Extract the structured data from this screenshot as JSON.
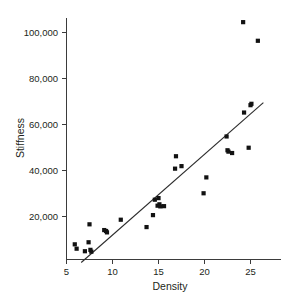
{
  "chart_data": {
    "type": "scatter",
    "title": "",
    "xlabel": "Density",
    "ylabel": "Stiffness",
    "xlim": [
      5,
      26.5
    ],
    "ylim": [
      0,
      108000
    ],
    "grid": false,
    "legend": null,
    "x_ticks": [
      5,
      10,
      15,
      20,
      25
    ],
    "x_tick_labels": [
      "5",
      "10",
      "15",
      "20",
      "25"
    ],
    "y_ticks": [
      20000,
      40000,
      60000,
      80000,
      100000
    ],
    "y_tick_labels": [
      "20,000",
      "40,000",
      "60,000",
      "80,000",
      "100,000"
    ],
    "marker": "square",
    "marker_color": "#121212",
    "points": [
      {
        "x": 5.9,
        "y": 7900
      },
      {
        "x": 6.1,
        "y": 6000
      },
      {
        "x": 7.0,
        "y": 4900
      },
      {
        "x": 7.4,
        "y": 8800
      },
      {
        "x": 7.5,
        "y": 16600
      },
      {
        "x": 7.6,
        "y": 5500
      },
      {
        "x": 7.7,
        "y": 4700
      },
      {
        "x": 9.1,
        "y": 14100
      },
      {
        "x": 9.3,
        "y": 13700
      },
      {
        "x": 9.4,
        "y": 13100
      },
      {
        "x": 10.9,
        "y": 18600
      },
      {
        "x": 13.7,
        "y": 15400
      },
      {
        "x": 14.4,
        "y": 20600
      },
      {
        "x": 14.6,
        "y": 27300
      },
      {
        "x": 14.9,
        "y": 24700
      },
      {
        "x": 15.0,
        "y": 28000
      },
      {
        "x": 15.1,
        "y": 25300
      },
      {
        "x": 15.2,
        "y": 24400
      },
      {
        "x": 15.6,
        "y": 24500
      },
      {
        "x": 16.8,
        "y": 40800
      },
      {
        "x": 16.9,
        "y": 46200
      },
      {
        "x": 17.5,
        "y": 41900
      },
      {
        "x": 19.9,
        "y": 30100
      },
      {
        "x": 20.2,
        "y": 37000
      },
      {
        "x": 22.4,
        "y": 54800
      },
      {
        "x": 22.5,
        "y": 48800
      },
      {
        "x": 22.6,
        "y": 48200
      },
      {
        "x": 23.0,
        "y": 47600
      },
      {
        "x": 24.2,
        "y": 104500
      },
      {
        "x": 24.3,
        "y": 65200
      },
      {
        "x": 24.8,
        "y": 49900
      },
      {
        "x": 25.0,
        "y": 68400
      },
      {
        "x": 25.1,
        "y": 69000
      },
      {
        "x": 25.8,
        "y": 96400
      }
    ],
    "fit_line": {
      "label": "least-squares fit",
      "x_start": 6.6,
      "y_start": 0,
      "x_end": 26.4,
      "y_end": 69500
    }
  },
  "figure": {
    "background_color": "#ffffff",
    "axis_color": "#3b3b3b"
  }
}
